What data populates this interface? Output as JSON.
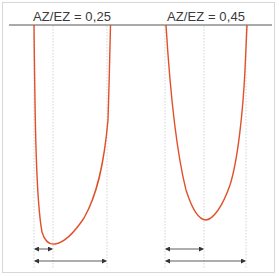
{
  "diagram": {
    "panels": [
      {
        "label": "AZ/EZ = 0,25",
        "ratio": 0.25,
        "curve": {
          "left_top_x": 34,
          "right_top_x": 110,
          "min_x": 55,
          "min_y": 244
        },
        "guides_x": [
          34,
          53,
          107
        ],
        "arrows": [
          {
            "from": 34,
            "to": 53,
            "y": 249,
            "type": "short"
          },
          {
            "from": 34,
            "to": 107,
            "y": 261,
            "type": "long"
          }
        ]
      },
      {
        "label": "AZ/EZ = 0,45",
        "ratio": 0.45,
        "curve": {
          "left_top_x": 166,
          "right_top_x": 247,
          "min_x": 206,
          "min_y": 220
        },
        "guides_x": [
          165,
          204,
          246
        ],
        "arrows": [
          {
            "from": 165,
            "to": 204,
            "y": 249,
            "type": "short"
          },
          {
            "from": 165,
            "to": 246,
            "y": 261,
            "type": "long"
          }
        ]
      }
    ],
    "colors": {
      "curve": "#e0502a",
      "baseline": "#555555",
      "guides": "#c8c8c8",
      "arrows": "#333333",
      "frame": "#d8d8d8",
      "text": "#3a3a3a"
    }
  }
}
